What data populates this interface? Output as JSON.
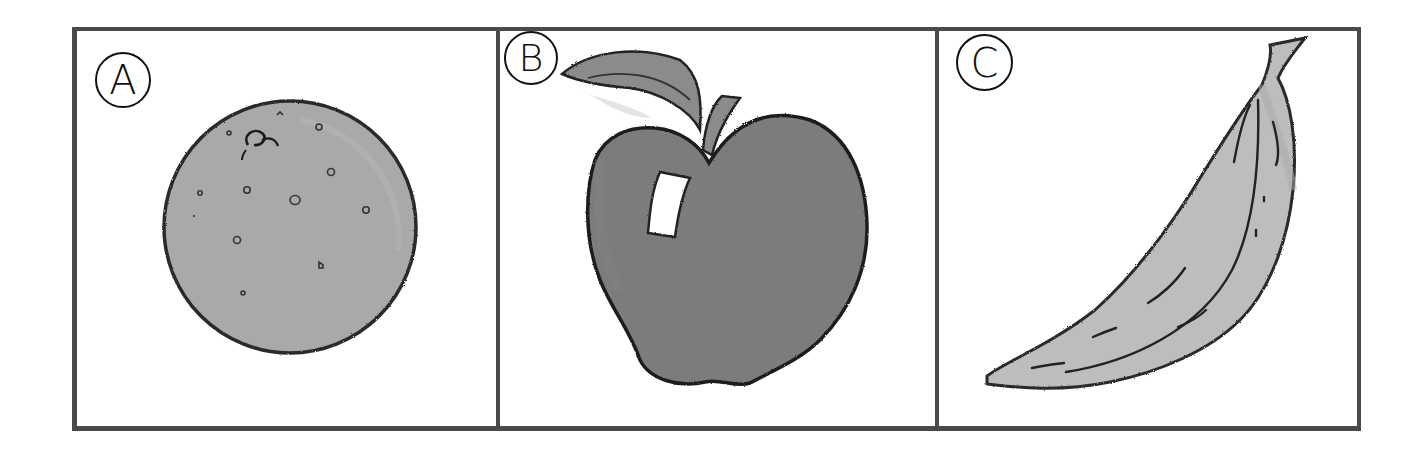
{
  "figure": {
    "panels": [
      {
        "label": "A",
        "fruit": "orange",
        "icon": "orange-icon",
        "fill_color": "#a9a9a9",
        "outline_color": "#2a2a2a"
      },
      {
        "label": "B",
        "fruit": "apple",
        "icon": "apple-icon",
        "fill_color": "#7b7b7b",
        "leaf_color": "#8a8a8a",
        "outline_color": "#222222"
      },
      {
        "label": "C",
        "fruit": "banana",
        "icon": "banana-icon",
        "fill_color": "#bdbdbd",
        "outline_color": "#2a2a2a"
      }
    ],
    "frame_color": "#4a4a4a",
    "background": "#ffffff"
  }
}
